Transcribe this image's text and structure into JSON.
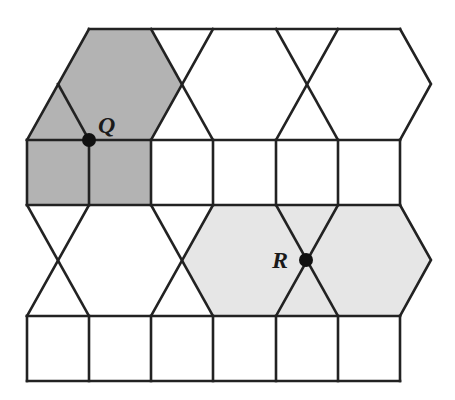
{
  "diagram": {
    "colors": {
      "background": "#ffffff",
      "line": "#222222",
      "dark_shade": "#b3b3b3",
      "light_shade": "#e6e6e6",
      "point": "#111111"
    },
    "grid": {
      "columns_x": [
        27,
        89,
        151,
        213,
        276,
        338,
        400
      ],
      "row_lines_y": [
        29,
        140,
        205,
        316,
        381
      ]
    },
    "regions": [
      {
        "name": "dark-shaded-region",
        "fill": "#b3b3b3",
        "points": "89,29 151,29 182,84 151,140 151,205 27,205 27,140 58,84"
      },
      {
        "name": "light-shaded-region",
        "fill": "#e6e6e6",
        "points": "213,205 400,205 431,260 400,316 213,316 182,260"
      }
    ],
    "points": [
      {
        "label": "Q",
        "x": 89,
        "y": 140,
        "label_x": 98,
        "label_y": 133
      },
      {
        "label": "R",
        "x": 306,
        "y": 260,
        "label_x": 272,
        "label_y": 268
      }
    ]
  }
}
